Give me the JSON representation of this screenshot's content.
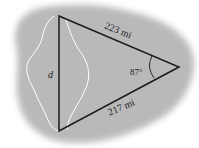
{
  "diagram": {
    "colors": {
      "background_blob": "#b9b9b9",
      "lines": "#1a1a1a",
      "lake_outline": "#ffffff"
    },
    "labels": {
      "top_side": "223 mi",
      "bottom_side": "217 mi",
      "left_side": "d",
      "angle": "87°"
    }
  }
}
